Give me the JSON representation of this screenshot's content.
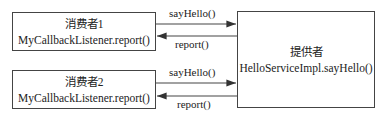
{
  "consumers": [
    {
      "title": "消费者1",
      "method": "MyCallbackListener.report()"
    },
    {
      "title": "消费者2",
      "method": "MyCallbackListener.report()"
    }
  ],
  "provider": {
    "title": "提供者",
    "method": "HelloServiceImpl.sayHello()"
  },
  "arrows": [
    {
      "label": "sayHello()",
      "direction": "consumer1-to-provider"
    },
    {
      "label": "report()",
      "direction": "provider-to-consumer1"
    },
    {
      "label": "sayHello()",
      "direction": "consumer2-to-provider"
    },
    {
      "label": "report()",
      "direction": "provider-to-consumer2"
    }
  ]
}
